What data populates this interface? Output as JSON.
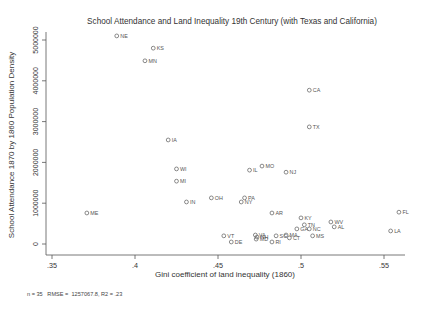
{
  "chart_data": {
    "type": "scatter",
    "title": "School Attendance and Land Inequality 19th Century (with Texas and California)",
    "xlabel": "Gini coefficient of land inequality (1860)",
    "ylabel": "School Attendance 1870 by 1860 Population Density",
    "xlim": [
      0.35,
      0.565
    ],
    "ylim": [
      0,
      5200000
    ],
    "x_ticks": [
      0.35,
      0.4,
      0.45,
      0.5,
      0.55
    ],
    "x_tick_labels": [
      ".35",
      ".4",
      ".45",
      ".5",
      ".55"
    ],
    "y_ticks": [
      0,
      1000000,
      2000000,
      3000000,
      4000000,
      5000000
    ],
    "y_tick_labels": [
      "0",
      "1000000",
      "2000000",
      "3000000",
      "4000000",
      "5000000"
    ],
    "grid": false,
    "legend": null,
    "marker": "hollow-circle",
    "footnote": "n = 35   RMSE =  1257067.8, R2 = .23",
    "points": [
      {
        "label": "NE",
        "x": 0.389,
        "y": 5100000
      },
      {
        "label": "KS",
        "x": 0.411,
        "y": 4800000
      },
      {
        "label": "MN",
        "x": 0.406,
        "y": 4490000
      },
      {
        "label": "CA",
        "x": 0.505,
        "y": 3770000
      },
      {
        "label": "TX",
        "x": 0.505,
        "y": 2870000
      },
      {
        "label": "IA",
        "x": 0.42,
        "y": 2550000
      },
      {
        "label": "WI",
        "x": 0.425,
        "y": 1840000
      },
      {
        "label": "MI",
        "x": 0.425,
        "y": 1540000
      },
      {
        "label": "MO",
        "x": 0.4765,
        "y": 1910000
      },
      {
        "label": "IL",
        "x": 0.469,
        "y": 1810000
      },
      {
        "label": "NJ",
        "x": 0.491,
        "y": 1760000
      },
      {
        "label": "IN",
        "x": 0.431,
        "y": 1030000
      },
      {
        "label": "OH",
        "x": 0.446,
        "y": 1130000
      },
      {
        "label": "PA",
        "x": 0.466,
        "y": 1130000
      },
      {
        "label": "NY",
        "x": 0.464,
        "y": 1030000
      },
      {
        "label": "ME",
        "x": 0.371,
        "y": 760000
      },
      {
        "label": "AR",
        "x": 0.4825,
        "y": 760000
      },
      {
        "label": "KY",
        "x": 0.5,
        "y": 640000
      },
      {
        "label": "TN",
        "x": 0.502,
        "y": 470000
      },
      {
        "label": "GA",
        "x": 0.4975,
        "y": 370000
      },
      {
        "label": "NC",
        "x": 0.505,
        "y": 370000
      },
      {
        "label": "WV",
        "x": 0.518,
        "y": 540000
      },
      {
        "label": "AL",
        "x": 0.52,
        "y": 420000
      },
      {
        "label": "FL",
        "x": 0.559,
        "y": 780000
      },
      {
        "label": "LA",
        "x": 0.554,
        "y": 320000
      },
      {
        "label": "MS",
        "x": 0.507,
        "y": 200000
      },
      {
        "label": "VT",
        "x": 0.4535,
        "y": 200000
      },
      {
        "label": "DE",
        "x": 0.458,
        "y": 50000
      },
      {
        "label": "VA",
        "x": 0.4725,
        "y": 220000
      },
      {
        "label": "NH",
        "x": 0.4735,
        "y": 170000
      },
      {
        "label": "MD",
        "x": 0.473,
        "y": 120000
      },
      {
        "label": "RI",
        "x": 0.4825,
        "y": 50000
      },
      {
        "label": "SC",
        "x": 0.485,
        "y": 200000
      },
      {
        "label": "MA",
        "x": 0.491,
        "y": 220000
      },
      {
        "label": "CT",
        "x": 0.493,
        "y": 150000
      }
    ]
  },
  "colors": {
    "marker": "#6b6b6b",
    "text": "#333333",
    "axis": "#555555"
  }
}
